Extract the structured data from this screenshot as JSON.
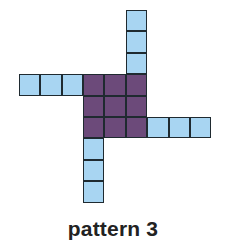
{
  "figure": {
    "caption": "pattern 3",
    "colors": {
      "arm": "#a8d5f2",
      "center": "#6c4a7a",
      "border": "#1f2a30"
    },
    "grid": {
      "cell_size_px": 21.4,
      "origin_px": [
        18.8,
        10
      ],
      "center_block": {
        "rows": 3,
        "cols": 3,
        "top_left_cell": [
          3,
          3
        ]
      },
      "arms": [
        {
          "name": "top",
          "cells": [
            [
              5,
              0
            ],
            [
              5,
              1
            ],
            [
              5,
              2
            ]
          ]
        },
        {
          "name": "left",
          "cells": [
            [
              0,
              3
            ],
            [
              1,
              3
            ],
            [
              2,
              3
            ]
          ]
        },
        {
          "name": "right",
          "cells": [
            [
              6,
              5
            ],
            [
              7,
              5
            ],
            [
              8,
              5
            ]
          ]
        },
        {
          "name": "bottom",
          "cells": [
            [
              3,
              6
            ],
            [
              3,
              7
            ],
            [
              3,
              8
            ]
          ]
        }
      ]
    }
  }
}
